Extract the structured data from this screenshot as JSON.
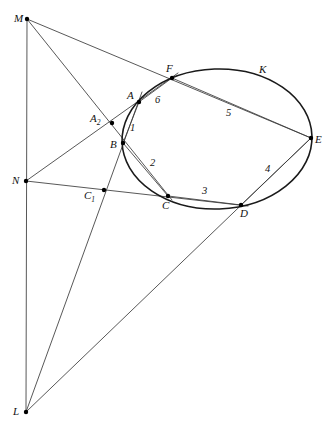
{
  "figure": {
    "type": "geometry-diagram",
    "canvas": {
      "width": 331,
      "height": 427,
      "background": "#ffffff"
    },
    "stroke_colors": {
      "conic": "#1a1a1a",
      "line": "#3a3a3a",
      "point": "#000000"
    },
    "conic": {
      "name": "K",
      "shape": "ellipse",
      "cx": 217,
      "cy": 139,
      "rx": 95,
      "ry": 70,
      "rotation_deg": -2
    },
    "points": [
      {
        "id": "M",
        "label": "M",
        "x": 27,
        "y": 19,
        "lx": 14,
        "ly": 13,
        "dot": true
      },
      {
        "id": "L",
        "label": "L",
        "x": 26,
        "y": 412,
        "lx": 13,
        "ly": 406,
        "dot": true
      },
      {
        "id": "N",
        "label": "N",
        "x": 26,
        "y": 181,
        "lx": 12,
        "ly": 175,
        "dot": true
      },
      {
        "id": "A",
        "label": "A",
        "x": 139,
        "y": 102,
        "lx": 127,
        "ly": 90,
        "dot": true
      },
      {
        "id": "B",
        "label": "B",
        "x": 123,
        "y": 143,
        "lx": 110,
        "ly": 139,
        "dot": true
      },
      {
        "id": "C",
        "label": "C",
        "x": 168,
        "y": 196,
        "lx": 162,
        "ly": 200,
        "dot": true
      },
      {
        "id": "D",
        "label": "D",
        "x": 241,
        "y": 205,
        "lx": 240,
        "ly": 208,
        "dot": true
      },
      {
        "id": "E",
        "label": "E",
        "x": 311,
        "y": 138,
        "lx": 315,
        "ly": 134,
        "dot": true
      },
      {
        "id": "F",
        "label": "F",
        "x": 172,
        "y": 78,
        "lx": 166,
        "ly": 63,
        "dot": true
      },
      {
        "id": "A2",
        "label": "A",
        "sub": "2",
        "x": 112,
        "y": 123,
        "lx": 90,
        "ly": 113,
        "dot": true
      },
      {
        "id": "C1",
        "label": "C",
        "sub": "1",
        "x": 104,
        "y": 190,
        "lx": 84,
        "ly": 190,
        "dot": true
      }
    ],
    "segment_numbers": [
      {
        "id": "1",
        "label": "1",
        "x": 130,
        "y": 123
      },
      {
        "id": "2",
        "label": "2",
        "x": 150,
        "y": 158
      },
      {
        "id": "3",
        "label": "3",
        "x": 202,
        "y": 186
      },
      {
        "id": "4",
        "label": "4",
        "x": 265,
        "y": 164
      },
      {
        "id": "5",
        "label": "5",
        "x": 226,
        "y": 108
      },
      {
        "id": "6",
        "label": "6",
        "x": 155,
        "y": 95
      }
    ],
    "conic_label": {
      "id": "K",
      "label": "K",
      "x": 259,
      "y": 64
    },
    "segments": [
      {
        "id": "seg-M-L",
        "name": "pascal-line-ML",
        "x1": 27,
        "y1": 19,
        "x2": 26,
        "y2": 412
      },
      {
        "id": "seg-M-E",
        "name": "line-M-F-E",
        "x1": 27,
        "y1": 19,
        "x2": 311,
        "y2": 138
      },
      {
        "id": "seg-M-C",
        "name": "line-M-A2-B-C",
        "x1": 27,
        "y1": 19,
        "x2": 172,
        "y2": 200
      },
      {
        "id": "seg-L-A",
        "name": "line-L-C1-A",
        "x1": 26,
        "y1": 412,
        "x2": 142,
        "y2": 92
      },
      {
        "id": "seg-L-E",
        "name": "line-L-D-E",
        "x1": 26,
        "y1": 412,
        "x2": 311,
        "y2": 138
      },
      {
        "id": "seg-N-F",
        "name": "line-N-A2-A-F",
        "x1": 26,
        "y1": 181,
        "x2": 178,
        "y2": 73
      },
      {
        "id": "seg-N-D",
        "name": "line-N-C1-C-D",
        "x1": 26,
        "y1": 181,
        "x2": 248,
        "y2": 206
      },
      {
        "id": "seg-A-B",
        "name": "chord-1-AB",
        "x1": 139,
        "y1": 102,
        "x2": 123,
        "y2": 143
      },
      {
        "id": "seg-B-C",
        "name": "chord-2-BC",
        "x1": 123,
        "y1": 143,
        "x2": 168,
        "y2": 196
      },
      {
        "id": "seg-C-D",
        "name": "chord-3-CD",
        "x1": 168,
        "y1": 196,
        "x2": 241,
        "y2": 205
      },
      {
        "id": "seg-D-E",
        "name": "chord-4-DE",
        "x1": 241,
        "y1": 205,
        "x2": 311,
        "y2": 138
      },
      {
        "id": "seg-E-F",
        "name": "chord-5-EF",
        "x1": 311,
        "y1": 138,
        "x2": 172,
        "y2": 78
      },
      {
        "id": "seg-F-A",
        "name": "chord-6-FA",
        "x1": 172,
        "y1": 78,
        "x2": 139,
        "y2": 102
      }
    ]
  }
}
